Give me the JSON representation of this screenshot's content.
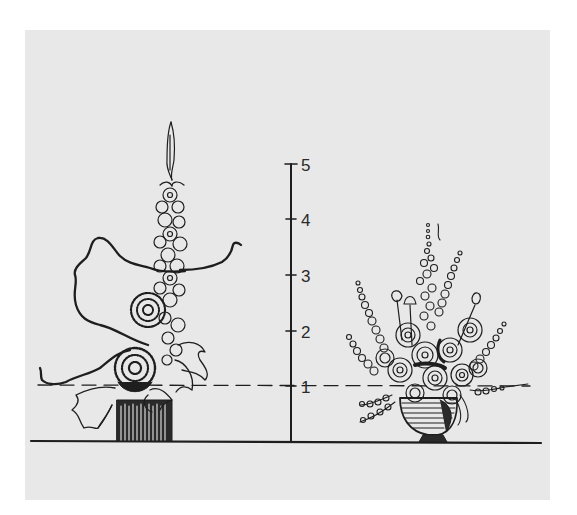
{
  "figure": {
    "background": "#e8e8e8",
    "ink": "#1e1e1e"
  },
  "scale": {
    "ticks": [
      {
        "label": "5",
        "y": 164
      },
      {
        "label": "4",
        "y": 219
      },
      {
        "label": "3",
        "y": 275
      },
      {
        "label": "2",
        "y": 331
      },
      {
        "label": "1",
        "y": 386
      }
    ],
    "axis_x": 291,
    "base_y": 442,
    "reference_line_label": "1"
  },
  "arrangements": [
    {
      "name": "vertical-line-arrangement",
      "container": "cylinder-vase"
    },
    {
      "name": "mass-arrangement",
      "container": "footed-bowl"
    }
  ]
}
